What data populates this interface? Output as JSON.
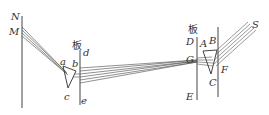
{
  "diagram": {
    "labels": {
      "N": "N",
      "M": "M",
      "a": "a",
      "b": "b",
      "c": "c",
      "d": "d",
      "e": "e",
      "board_left": "板",
      "board_right": "板",
      "D": "D",
      "E": "E",
      "G": "G",
      "A": "A",
      "B": "B",
      "C": "C",
      "F": "F",
      "S": "S"
    },
    "colors": {
      "line": "#444444",
      "background": "#ffffff"
    }
  }
}
